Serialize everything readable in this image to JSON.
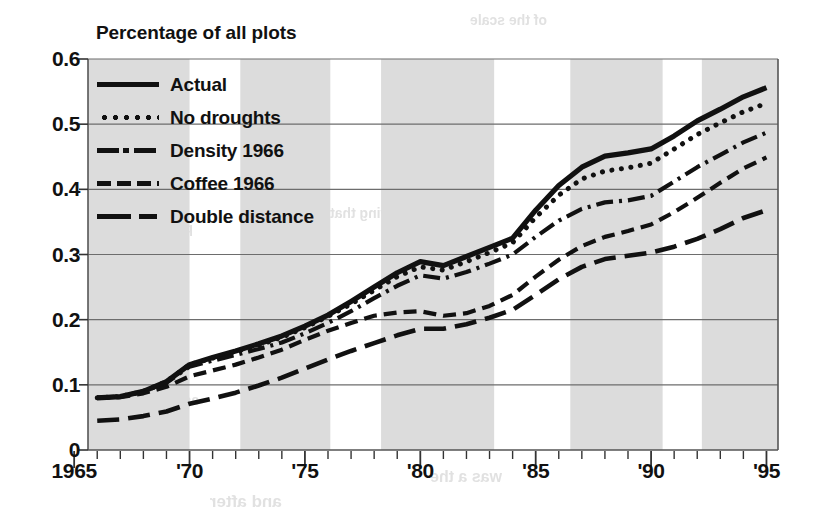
{
  "chart_data": {
    "type": "line",
    "title": "Percentage of all plots",
    "xlabel": "",
    "ylabel": "Percentage of all plots",
    "xlim": [
      1965.6,
      1995.5
    ],
    "ylim": [
      0,
      0.6
    ],
    "grid": true,
    "legend_position": "top-left",
    "y_ticks": [
      "0.6",
      "0.5",
      "0.4",
      "0.3",
      "0.2",
      "0.1",
      "0"
    ],
    "y_tick_values": [
      0.6,
      0.5,
      0.4,
      0.3,
      0.2,
      0.1,
      0
    ],
    "x_ticks": [
      "1965",
      "'70",
      "'75",
      "'80",
      "'85",
      "'90",
      "'95"
    ],
    "x_tick_values": [
      1965,
      1970,
      1975,
      1980,
      1985,
      1990,
      1995
    ],
    "x_minor_tick_step": 1,
    "shaded_bands": [
      [
        1965.6,
        1970.0
      ],
      [
        1972.2,
        1976.1
      ],
      [
        1978.3,
        1983.2
      ],
      [
        1986.5,
        1990.5
      ],
      [
        1992.2,
        1995.5
      ]
    ],
    "shade_color": "#dcdcdc",
    "x": [
      1966,
      1967,
      1968,
      1969,
      1970,
      1971,
      1972,
      1973,
      1974,
      1975,
      1976,
      1977,
      1978,
      1979,
      1980,
      1981,
      1982,
      1983,
      1984,
      1985,
      1986,
      1987,
      1988,
      1989,
      1990,
      1991,
      1992,
      1993,
      1994,
      1995
    ],
    "series": [
      {
        "name": "Actual",
        "style": "solid",
        "color": "#111111",
        "values": [
          0.08,
          0.082,
          0.09,
          0.105,
          0.131,
          0.142,
          0.152,
          0.163,
          0.175,
          0.19,
          0.207,
          0.228,
          0.25,
          0.272,
          0.289,
          0.283,
          0.297,
          0.311,
          0.325,
          0.368,
          0.406,
          0.434,
          0.451,
          0.456,
          0.462,
          0.482,
          0.505,
          0.523,
          0.542,
          0.556
        ]
      },
      {
        "name": "No droughts",
        "style": "dotted",
        "color": "#111111",
        "values": [
          0.08,
          0.082,
          0.09,
          0.105,
          0.131,
          0.141,
          0.151,
          0.161,
          0.173,
          0.188,
          0.205,
          0.224,
          0.245,
          0.266,
          0.281,
          0.276,
          0.289,
          0.303,
          0.318,
          0.357,
          0.391,
          0.416,
          0.428,
          0.433,
          0.44,
          0.462,
          0.484,
          0.502,
          0.519,
          0.532
        ]
      },
      {
        "name": "Density 1966",
        "style": "dashdot",
        "color": "#111111",
        "values": [
          0.08,
          0.082,
          0.09,
          0.103,
          0.128,
          0.137,
          0.146,
          0.155,
          0.165,
          0.179,
          0.195,
          0.213,
          0.233,
          0.252,
          0.268,
          0.263,
          0.273,
          0.286,
          0.3,
          0.327,
          0.352,
          0.37,
          0.38,
          0.383,
          0.39,
          0.412,
          0.434,
          0.453,
          0.472,
          0.487
        ]
      },
      {
        "name": "Coffee 1966",
        "style": "dashed",
        "color": "#111111",
        "values": [
          0.08,
          0.081,
          0.087,
          0.097,
          0.113,
          0.122,
          0.131,
          0.142,
          0.154,
          0.169,
          0.183,
          0.195,
          0.206,
          0.211,
          0.213,
          0.206,
          0.21,
          0.221,
          0.238,
          0.266,
          0.292,
          0.313,
          0.327,
          0.336,
          0.346,
          0.365,
          0.387,
          0.41,
          0.432,
          0.449
        ]
      },
      {
        "name": "Double distance",
        "style": "longdash",
        "color": "#111111",
        "values": [
          0.045,
          0.047,
          0.052,
          0.059,
          0.071,
          0.079,
          0.088,
          0.099,
          0.111,
          0.125,
          0.139,
          0.152,
          0.164,
          0.176,
          0.186,
          0.186,
          0.193,
          0.203,
          0.215,
          0.238,
          0.262,
          0.281,
          0.293,
          0.298,
          0.303,
          0.312,
          0.324,
          0.339,
          0.356,
          0.368
        ]
      }
    ]
  },
  "ghost_text": [
    {
      "text": "of the scale",
      "x": 470,
      "y": 12,
      "size": 14
    },
    {
      "text": "production",
      "x": 120,
      "y": 220,
      "size": 14
    },
    {
      "text": "the growing that",
      "x": 330,
      "y": 205,
      "size": 14
    },
    {
      "text": "as the decline in",
      "x": 90,
      "y": 392,
      "size": 14
    },
    {
      "text": "was a the",
      "x": 430,
      "y": 468,
      "size": 16
    },
    {
      "text": "and after",
      "x": 210,
      "y": 492,
      "size": 17
    }
  ]
}
